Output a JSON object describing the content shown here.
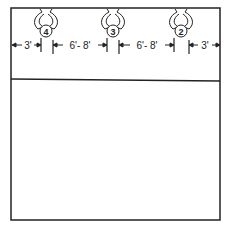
{
  "diagram": {
    "players": [
      {
        "number": "4",
        "cx": 46
      },
      {
        "number": "3",
        "cx": 113
      },
      {
        "number": "2",
        "cx": 181
      }
    ],
    "dimensions": [
      {
        "label": "3'",
        "x": 28
      },
      {
        "label": "6'- 8'",
        "x": 80
      },
      {
        "label": "6'- 8'",
        "x": 147
      },
      {
        "label": "3'",
        "x": 205
      }
    ],
    "colors": {
      "line": "#222222",
      "background": "#ffffff"
    }
  }
}
